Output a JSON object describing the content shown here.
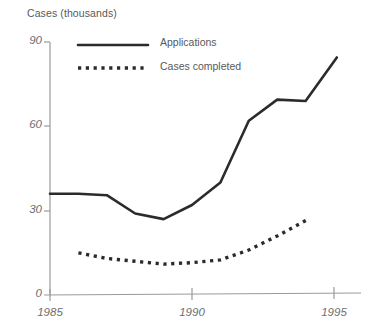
{
  "chart_data": {
    "type": "line",
    "title": "",
    "subtitle": "",
    "ylabel": "Cases (thousands)",
    "xlabel": "",
    "xlim": [
      1985,
      1995.1
    ],
    "ylim": [
      0,
      90
    ],
    "grid": false,
    "legend_position": "top-center-inside",
    "y_ticks": [
      0,
      30,
      60,
      90
    ],
    "y_tick_labels": [
      "0",
      "30",
      "60",
      "90"
    ],
    "x_ticks": [
      1985,
      1990,
      1995
    ],
    "x_tick_labels": [
      "1985",
      "1990",
      "1995"
    ],
    "series": [
      {
        "name": "Applications",
        "style": "solid",
        "color": "#2b2b2b",
        "x": [
          1985,
          1986,
          1987,
          1988,
          1989,
          1990,
          1991,
          1992,
          1993,
          1994,
          1995.1
        ],
        "values": [
          36,
          36,
          35.5,
          29,
          27,
          32,
          40,
          62,
          69.5,
          69,
          84.5
        ]
      },
      {
        "name": "Cases completed",
        "style": "dotted",
        "color": "#2b2b2b",
        "x": [
          1986,
          1987,
          1988,
          1989,
          1990,
          1991,
          1992,
          1993,
          1994.1
        ],
        "values": [
          15,
          13,
          12,
          11,
          11.5,
          12.5,
          16,
          21,
          27
        ]
      }
    ]
  },
  "legend": {
    "items": [
      {
        "label": "Applications",
        "style": "solid"
      },
      {
        "label": "Cases completed",
        "style": "dotted"
      }
    ]
  },
  "colors": {
    "line": "#2b2b2b",
    "axis": "#9a9a9a",
    "text": "#58595b",
    "tick_text": "#6d6e71",
    "background": "#ffffff"
  }
}
